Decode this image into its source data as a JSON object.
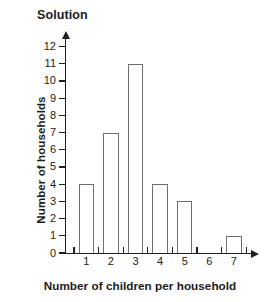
{
  "chart_data": {
    "type": "bar",
    "title": "Solution",
    "xlabel": "Number of children per household",
    "ylabel": "Number of households",
    "categories": [
      "1",
      "2",
      "3",
      "4",
      "5",
      "6",
      "7"
    ],
    "values": [
      4,
      7,
      11,
      4,
      3,
      0,
      1
    ],
    "series": [
      {
        "name": "Number of households",
        "values": [
          4,
          7,
          11,
          4,
          3,
          0,
          1
        ]
      }
    ],
    "ylim": [
      0,
      12
    ],
    "xlim": [
      0,
      7
    ],
    "ytick_labels": [
      "0",
      "1",
      "2",
      "3",
      "4",
      "5",
      "6",
      "7",
      "8",
      "9",
      "10",
      "11",
      "12"
    ],
    "ytick_values": [
      0,
      1,
      2,
      3,
      4,
      5,
      6,
      7,
      8,
      9,
      10,
      11,
      12
    ],
    "xtick_labels": [
      "1",
      "2",
      "3",
      "4",
      "5",
      "6",
      "7"
    ],
    "grid": false,
    "legend": false,
    "legend_position": "none",
    "bar_fill_color": "#ffffff",
    "bar_edge_color": "#6e6e6e",
    "axis_color": "#1f1f1f",
    "text_color": "#1b1b1b",
    "background_color": "#ffffff",
    "y_axis_arrow": true,
    "x_axis_arrow": true
  }
}
